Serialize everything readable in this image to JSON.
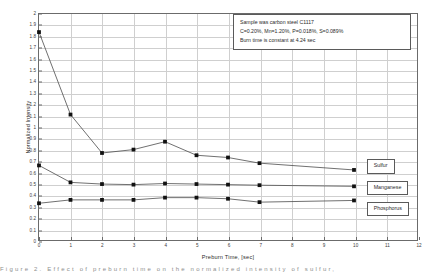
{
  "chart_data": {
    "type": "line",
    "title": "",
    "xlabel": "Preburn Time, [sec]",
    "ylabel": "Normalized Intensity",
    "xlim": [
      0,
      12
    ],
    "ylim": [
      0,
      2
    ],
    "grid": true,
    "legend_position": "right-inline",
    "x_ticks": [
      "0",
      "1",
      "2",
      "3",
      "4",
      "5",
      "6",
      "7",
      "8",
      "9",
      "10",
      "11",
      "12"
    ],
    "y_ticks": [
      "0",
      "0.1",
      "0.2",
      "0.3",
      "0.4",
      "0.5",
      "0.6",
      "0.7",
      "0.8",
      "0.9",
      "1",
      "1.1",
      "1.2",
      "1.3",
      "1.4",
      "1.5",
      "1.6",
      "1.7",
      "1.8",
      "1.9",
      "2"
    ],
    "series": [
      {
        "name": "Sulfur",
        "x": [
          0,
          1,
          2,
          3,
          4,
          5,
          6,
          7,
          10
        ],
        "values": [
          1.84,
          1.11,
          0.77,
          0.8,
          0.87,
          0.75,
          0.73,
          0.68,
          0.62
        ]
      },
      {
        "name": "Manganese",
        "x": [
          0,
          1,
          2,
          3,
          4,
          5,
          6,
          7,
          10
        ],
        "values": [
          0.66,
          0.51,
          0.495,
          0.49,
          0.5,
          0.495,
          0.49,
          0.485,
          0.475
        ]
      },
      {
        "name": "Phosphorus",
        "x": [
          0,
          1,
          2,
          3,
          4,
          5,
          6,
          7,
          10
        ],
        "values": [
          0.325,
          0.355,
          0.355,
          0.355,
          0.375,
          0.375,
          0.365,
          0.335,
          0.35
        ]
      }
    ],
    "annotations": [
      "Sample was carbon steel C1117",
      "C=0.20%, Mn=1.20%, P=0.018%, S=0.089%",
      "Burn time is constant at 4.24 sec"
    ]
  },
  "colors": {
    "line": "#4a4a4a",
    "marker": "#111111",
    "grid": "#cfcfcf",
    "frame": "#6b6b6b",
    "text": "#2b2b2b"
  },
  "caption": {
    "text": "Figure 2.  Effect of preburn time on the normalized intensity of sulfur,"
  }
}
